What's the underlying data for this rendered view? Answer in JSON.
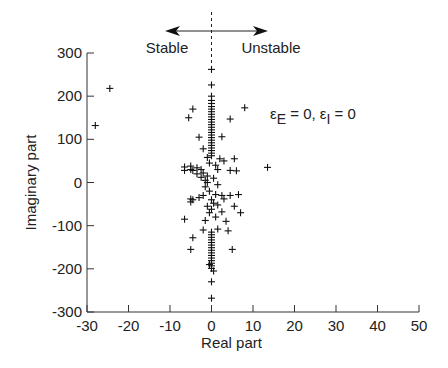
{
  "chart_data": {
    "type": "scatter",
    "title": "",
    "xlabel": "Real part",
    "ylabel": "Imaginary part",
    "xlim": [
      -30,
      50
    ],
    "ylim": [
      -300,
      300
    ],
    "xticks": [
      -30,
      -20,
      -10,
      0,
      10,
      20,
      30,
      40,
      50
    ],
    "yticks": [
      -300,
      -200,
      -100,
      0,
      100,
      200,
      300
    ],
    "xtick_labels": [
      "-30",
      "-20",
      "-10",
      "0",
      "10",
      "20",
      "30",
      "40",
      "50"
    ],
    "ytick_labels": [
      "-300",
      "-200",
      "-100",
      "0",
      "100",
      "200",
      "300"
    ],
    "grid": false,
    "marker": "+",
    "annotations": {
      "stable_label": "Stable",
      "unstable_label": "Unstable",
      "condition_eps": "ε",
      "condition_sub_e": "E",
      "condition_mid": " = 0, ε",
      "condition_sub_i": "I",
      "condition_end": " = 0",
      "divider_x": 0
    },
    "series": [
      {
        "name": "eigenvalues",
        "points": [
          [
            -28,
            132
          ],
          [
            -24.5,
            218
          ],
          [
            0,
            262
          ],
          [
            0,
            226
          ],
          [
            0,
            200
          ],
          [
            0,
            190
          ],
          [
            0,
            183
          ],
          [
            0,
            176
          ],
          [
            0,
            170
          ],
          [
            0,
            164
          ],
          [
            0,
            158
          ],
          [
            0,
            152
          ],
          [
            0,
            146
          ],
          [
            0,
            140
          ],
          [
            0,
            134
          ],
          [
            0,
            128
          ],
          [
            0,
            122
          ],
          [
            0,
            116
          ],
          [
            0,
            110
          ],
          [
            0,
            104
          ],
          [
            0,
            98
          ],
          [
            0,
            92
          ],
          [
            0,
            86
          ],
          [
            0,
            80
          ],
          [
            0,
            74
          ],
          [
            0,
            68
          ],
          [
            0,
            62
          ],
          [
            -4.5,
            170
          ],
          [
            -5.5,
            150
          ],
          [
            8,
            173
          ],
          [
            4.5,
            147
          ],
          [
            -3,
            105
          ],
          [
            2.5,
            106
          ],
          [
            -2,
            78
          ],
          [
            -1,
            58
          ],
          [
            -0.5,
            45
          ],
          [
            -6.5,
            36
          ],
          [
            -6.5,
            28
          ],
          [
            -4.5,
            28
          ],
          [
            -3.5,
            20
          ],
          [
            -2.5,
            12
          ],
          [
            -1.5,
            5
          ],
          [
            -1,
            0
          ],
          [
            -5,
            38
          ],
          [
            -5,
            30
          ],
          [
            -3.5,
            34
          ],
          [
            -2.5,
            30
          ],
          [
            -2,
            22
          ],
          [
            1,
            40
          ],
          [
            1.5,
            30
          ],
          [
            4.5,
            28
          ],
          [
            6,
            27
          ],
          [
            3,
            50
          ],
          [
            5.5,
            55
          ],
          [
            2,
            55
          ],
          [
            13.5,
            35
          ],
          [
            -1,
            15
          ],
          [
            0.5,
            10
          ],
          [
            1.5,
            -5
          ],
          [
            -1.5,
            -10
          ],
          [
            -0.5,
            -20
          ],
          [
            1,
            -28
          ],
          [
            2.5,
            -30
          ],
          [
            -2,
            -30
          ],
          [
            -3,
            -35
          ],
          [
            -4.5,
            -40
          ],
          [
            -5,
            -45
          ],
          [
            -5,
            -38
          ],
          [
            0,
            -40
          ],
          [
            0.5,
            -48
          ],
          [
            1.5,
            -52
          ],
          [
            3,
            -38
          ],
          [
            4.5,
            -30
          ],
          [
            6.5,
            -28
          ],
          [
            -1,
            -55
          ],
          [
            0,
            -62
          ],
          [
            -0.5,
            -70
          ],
          [
            1,
            -80
          ],
          [
            2.5,
            -68
          ],
          [
            -1.5,
            -88
          ],
          [
            3.5,
            -90
          ],
          [
            5.5,
            -55
          ],
          [
            7,
            -70
          ],
          [
            -6.5,
            -85
          ],
          [
            -2,
            -110
          ],
          [
            1.5,
            -108
          ],
          [
            4,
            -112
          ],
          [
            -4.5,
            -128
          ],
          [
            -5,
            -155
          ],
          [
            5,
            -155
          ],
          [
            0,
            -115
          ],
          [
            0,
            -121
          ],
          [
            0,
            -127
          ],
          [
            0,
            -133
          ],
          [
            0,
            -139
          ],
          [
            0,
            -145
          ],
          [
            0,
            -151
          ],
          [
            0,
            -157
          ],
          [
            0,
            -163
          ],
          [
            0,
            -169
          ],
          [
            0,
            -175
          ],
          [
            0,
            -181
          ],
          [
            0,
            -187
          ],
          [
            0,
            -193
          ],
          [
            -0.5,
            -190
          ],
          [
            0,
            -199
          ],
          [
            0.5,
            -205
          ],
          [
            0,
            -230
          ],
          [
            0,
            -268
          ]
        ]
      }
    ]
  }
}
